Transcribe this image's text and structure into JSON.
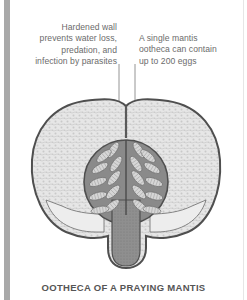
{
  "figure": {
    "caption": "OOTHECA OF A PRAYING MANTIS",
    "annotations": [
      {
        "id": "hardened-wall",
        "lines": [
          "Hardened wall",
          "prevents water loss,",
          "predation, and",
          "infection by parasites"
        ]
      },
      {
        "id": "egg-count",
        "lines": [
          "A single mantis",
          "ootheca can contain",
          "up to 200 eggs"
        ]
      }
    ],
    "illustration": "ootheca-cross-section",
    "colors": {
      "wall_fill": "#e4e4e4",
      "outline": "#5a5a5a",
      "egg_chamber": "#8e8e8e",
      "egg": "#d0d0d0",
      "side_bar": "#a9a9a9",
      "text": "#6b6b6b"
    }
  }
}
